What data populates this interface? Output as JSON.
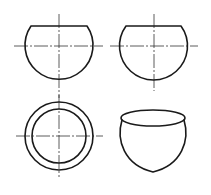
{
  "diagram": {
    "type": "orthographic-projection",
    "colors": {
      "outline": "#1a1a1a",
      "centerline": "#333333",
      "background": "#ffffff"
    },
    "views": [
      {
        "name": "front-view",
        "position": "top-left",
        "description": "Front view: circle truncated by flat top edge with centerlines"
      },
      {
        "name": "side-view",
        "position": "top-right",
        "description": "Side view: circle truncated by flat top edge with centerlines"
      },
      {
        "name": "top-view",
        "position": "bottom-left",
        "description": "Top view: two concentric circles with centerlines"
      },
      {
        "name": "isometric-view",
        "position": "bottom-right",
        "description": "Pictorial view: bowl with elliptical opening"
      }
    ]
  }
}
